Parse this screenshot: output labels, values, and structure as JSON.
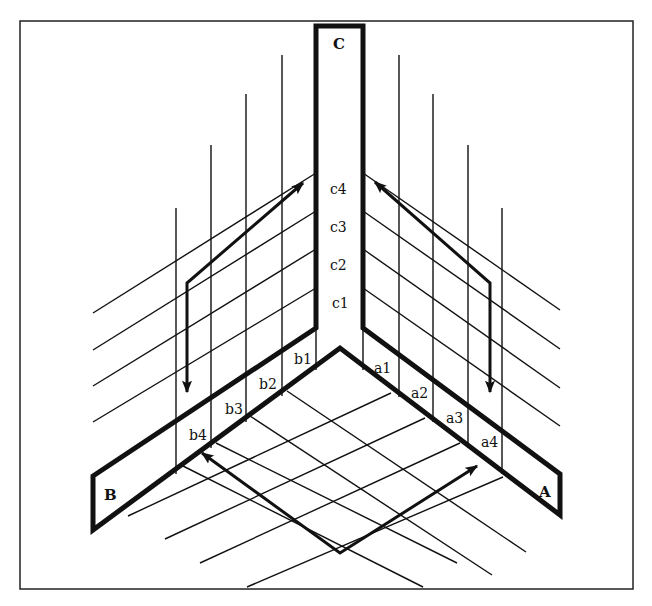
{
  "diagram": {
    "type": "isometric corner diagram",
    "frame": {
      "x": 20,
      "y": 21,
      "width": 613,
      "height": 568
    },
    "planes": {
      "C": {
        "label": "C",
        "strip_labels": [
          "c4",
          "c3",
          "c2",
          "c1"
        ]
      },
      "B": {
        "label": "B",
        "strip_labels": [
          "b1",
          "b2",
          "b3",
          "b4"
        ]
      },
      "A": {
        "label": "A",
        "strip_labels": [
          "a1",
          "a2",
          "a3",
          "a4"
        ]
      }
    },
    "labels": {
      "C": "C",
      "B": "B",
      "A": "A",
      "c1": "c1",
      "c2": "c2",
      "c3": "c3",
      "c4": "c4",
      "b1": "b1",
      "b2": "b2",
      "b3": "b3",
      "b4": "b4",
      "a1": "a1",
      "a2": "a2",
      "a3": "a3",
      "a4": "a4"
    },
    "arrows": [
      {
        "name": "left-wall-arrow",
        "description": "double-headed path: up-right toward c4, down toward b4"
      },
      {
        "name": "right-wall-arrow",
        "description": "double-headed path: up-left toward c4, down toward a4"
      },
      {
        "name": "floor-arrow",
        "description": "double-headed V path: toward b4 and toward a4"
      }
    ],
    "colors": {
      "line": "#111111",
      "background": "#ffffff"
    }
  }
}
